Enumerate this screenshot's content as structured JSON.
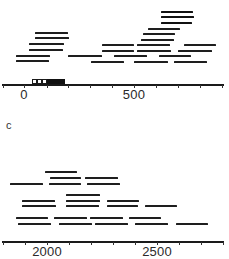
{
  "figure": {
    "type": "contig-map",
    "panels": [
      {
        "id": "top",
        "axis": {
          "y": 84,
          "x_start": 2,
          "x_end": 224,
          "px_per_100": 22,
          "origin_px": 24,
          "origin_value": 0,
          "ticks_px": [
            3,
            24,
            47,
            68,
            90,
            112,
            134,
            156,
            178,
            200,
            222
          ],
          "labels": [
            {
              "text": "0",
              "x": 24
            },
            {
              "text": "500",
              "x": 134
            }
          ]
        },
        "scale_marker": {
          "y": 79,
          "height": 5,
          "open_boxes": [
            {
              "x": 32,
              "w": 5
            },
            {
              "x": 37,
              "w": 5
            },
            {
              "x": 42,
              "w": 5
            }
          ],
          "filled": {
            "x": 47,
            "w": 18
          }
        },
        "segments": [
          {
            "y": 12,
            "x1": 161,
            "x2": 193,
            "thick": true
          },
          {
            "y": 17,
            "x1": 161,
            "x2": 194,
            "thick": true
          },
          {
            "y": 23,
            "x1": 161,
            "x2": 192,
            "thick": true
          },
          {
            "y": 29,
            "x1": 148,
            "x2": 180
          },
          {
            "y": 33,
            "x1": 35,
            "x2": 68
          },
          {
            "y": 34,
            "x1": 143,
            "x2": 175
          },
          {
            "y": 38,
            "x1": 35,
            "x2": 69
          },
          {
            "y": 40,
            "x1": 141,
            "x2": 174
          },
          {
            "y": 44,
            "x1": 29,
            "x2": 64
          },
          {
            "y": 45,
            "x1": 102,
            "x2": 134
          },
          {
            "y": 45,
            "x1": 137,
            "x2": 170
          },
          {
            "y": 45,
            "x1": 184,
            "x2": 216
          },
          {
            "y": 50,
            "x1": 29,
            "x2": 63
          },
          {
            "y": 51,
            "x1": 102,
            "x2": 134
          },
          {
            "y": 51,
            "x1": 137,
            "x2": 171
          },
          {
            "y": 51,
            "x1": 178,
            "x2": 212
          },
          {
            "y": 56,
            "x1": 16,
            "x2": 50
          },
          {
            "y": 56,
            "x1": 68,
            "x2": 102
          },
          {
            "y": 56,
            "x1": 114,
            "x2": 147
          },
          {
            "y": 56,
            "x1": 159,
            "x2": 191
          },
          {
            "y": 61,
            "x1": 16,
            "x2": 49
          },
          {
            "y": 62,
            "x1": 91,
            "x2": 124
          },
          {
            "y": 62,
            "x1": 134,
            "x2": 168
          },
          {
            "y": 62,
            "x1": 174,
            "x2": 207
          }
        ]
      },
      {
        "id": "c",
        "label": {
          "text": "c",
          "x": 6,
          "y": 119
        },
        "axis": {
          "y": 241,
          "x_start": 2,
          "x_end": 224,
          "px_per_100": 22,
          "origin_px": 47,
          "origin_value": 2000,
          "ticks_px": [
            3,
            25,
            47,
            69,
            91,
            113,
            135,
            157,
            179,
            201,
            223
          ],
          "labels": [
            {
              "text": "2000",
              "x": 47
            },
            {
              "text": "2500",
              "x": 157
            }
          ]
        },
        "segments": [
          {
            "y": 172,
            "x1": 45,
            "x2": 77
          },
          {
            "y": 178,
            "x1": 50,
            "x2": 81
          },
          {
            "y": 178,
            "x1": 85,
            "x2": 118
          },
          {
            "y": 184,
            "x1": 10,
            "x2": 43
          },
          {
            "y": 184,
            "x1": 49,
            "x2": 81
          },
          {
            "y": 184,
            "x1": 87,
            "x2": 120
          },
          {
            "y": 195,
            "x1": 66,
            "x2": 100
          },
          {
            "y": 201,
            "x1": 22,
            "x2": 55
          },
          {
            "y": 201,
            "x1": 66,
            "x2": 100
          },
          {
            "y": 201,
            "x1": 107,
            "x2": 139
          },
          {
            "y": 206,
            "x1": 22,
            "x2": 56
          },
          {
            "y": 206,
            "x1": 66,
            "x2": 99
          },
          {
            "y": 206,
            "x1": 107,
            "x2": 138
          },
          {
            "y": 206,
            "x1": 145,
            "x2": 177
          },
          {
            "y": 218,
            "x1": 16,
            "x2": 48
          },
          {
            "y": 218,
            "x1": 54,
            "x2": 87
          },
          {
            "y": 218,
            "x1": 90,
            "x2": 123
          },
          {
            "y": 218,
            "x1": 129,
            "x2": 161
          },
          {
            "y": 224,
            "x1": 18,
            "x2": 51
          },
          {
            "y": 224,
            "x1": 59,
            "x2": 92
          },
          {
            "y": 224,
            "x1": 95,
            "x2": 128
          },
          {
            "y": 224,
            "x1": 135,
            "x2": 168
          },
          {
            "y": 224,
            "x1": 176,
            "x2": 208
          }
        ]
      }
    ]
  },
  "colors": {
    "line": "#1e1e1e",
    "axis": "#1a1a1a",
    "background": "#ffffff",
    "text": "#2a2a2a"
  }
}
